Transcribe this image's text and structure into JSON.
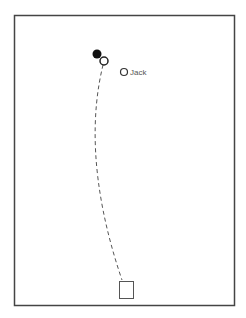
{
  "diagram": {
    "frame": {
      "x": 14,
      "y": 15,
      "width": 220,
      "height": 290,
      "stroke": "#444444"
    },
    "players": [
      {
        "id": "filled",
        "x": 97,
        "y": 54,
        "r": 4.5,
        "fill": "#111111",
        "stroke": "#111111"
      },
      {
        "id": "open-main",
        "x": 104,
        "y": 61,
        "r": 4,
        "fill": "#ffffff",
        "stroke": "#222222"
      },
      {
        "id": "jack",
        "x": 124,
        "y": 72,
        "r": 3.5,
        "fill": "#ffffff",
        "stroke": "#333333",
        "label": "Jack"
      }
    ],
    "path": {
      "style": "dashed",
      "stroke": "#555555",
      "from": [
        103,
        65
      ],
      "to": [
        122,
        280
      ]
    },
    "box": {
      "x": 119,
      "y": 281,
      "width": 14,
      "height": 17,
      "stroke": "#555555"
    }
  }
}
